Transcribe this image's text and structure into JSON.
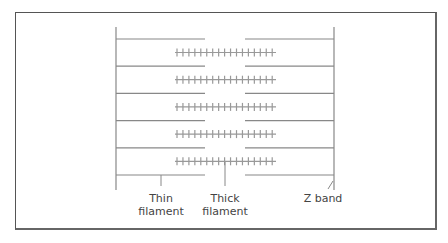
{
  "diagram": {
    "labels": {
      "thin": {
        "line1": "Thin",
        "line2": "filament"
      },
      "thick": {
        "line1": "Thick",
        "line2": "filament"
      },
      "zband": "Z band"
    },
    "colors": {
      "line": "#888888",
      "thick": "#999999",
      "frame": "#555555"
    },
    "rows": 5,
    "ticks_per_thick_filament": 17
  }
}
